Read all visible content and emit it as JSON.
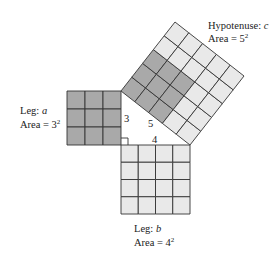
{
  "diagram": {
    "colors": {
      "background": "#ffffff",
      "dark_fill": "#a9a9a9",
      "light_fill": "#e9e9e9",
      "grid_line": "#333333",
      "text": "#222222"
    },
    "triangle": {
      "vertex_top": [
        121,
        91
      ],
      "vertex_right_angle": [
        121,
        145
      ],
      "vertex_right": [
        190,
        145
      ],
      "side_labels": {
        "a": "3",
        "b": "4",
        "c": "5"
      }
    },
    "squares": {
      "leg_a": {
        "cells": 3,
        "fill": "dark",
        "label_name": "Leg: ",
        "label_var": "a",
        "area_text": "Area = 3",
        "area_exp": "2"
      },
      "leg_b": {
        "cells": 4,
        "fill": "light",
        "label_name": "Leg: ",
        "label_var": "b",
        "area_text": "Area = 4",
        "area_exp": "2"
      },
      "hypotenuse": {
        "cells": 5,
        "dark_block": 3,
        "label_name": "Hypotenuse: ",
        "label_var": "c",
        "area_text": "Area = 5",
        "area_exp": "2"
      }
    }
  }
}
